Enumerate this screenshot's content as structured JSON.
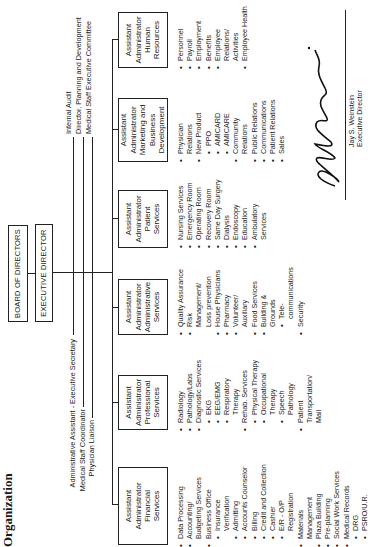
{
  "title": "Organization",
  "board": {
    "label": "BOARD OF DIRECTORS"
  },
  "executive": {
    "label": "EXECUTIVE DIRECTOR"
  },
  "staff_left": [
    "Administrative Assistant - Executive Secretary",
    "Medical Staff Coordinator",
    "Physician Liaison"
  ],
  "staff_right": [
    "Internal Audit",
    "Director, Planning and Development",
    "Medical Staff Executive Committee"
  ],
  "departments": [
    {
      "box": [
        "Assistant",
        "Administrator",
        "Financial",
        "Services"
      ],
      "items": [
        {
          "t": "Data Processing",
          "k": "b"
        },
        {
          "t": "Accounting/",
          "k": "b"
        },
        {
          "t": "Budgeting Services",
          "k": "cont"
        },
        {
          "t": "Business Office",
          "k": "b"
        },
        {
          "t": "Insurance",
          "k": "sub"
        },
        {
          "t": "Verification",
          "k": "subcont"
        },
        {
          "t": "Admitting",
          "k": "sub"
        },
        {
          "t": "Accounts Counselor",
          "k": "sub"
        },
        {
          "t": "Billing",
          "k": "sub"
        },
        {
          "t": "Credit and Collection",
          "k": "sub"
        },
        {
          "t": "Cashier",
          "k": "sub"
        },
        {
          "t": "E/R - O/P",
          "k": "sub"
        },
        {
          "t": "Registration",
          "k": "subcont"
        },
        {
          "t": "Materials",
          "k": "b"
        },
        {
          "t": "Management",
          "k": "cont"
        },
        {
          "t": "Plaza Building",
          "k": "b"
        },
        {
          "t": "Pre-planning",
          "k": "b"
        },
        {
          "t": "Social Work Services",
          "k": "b"
        },
        {
          "t": "Medical Records",
          "k": "b"
        },
        {
          "t": "DRG",
          "k": "sub"
        },
        {
          "t": "PSRO/U.R.",
          "k": "sub"
        }
      ]
    },
    {
      "box": [
        "Assistant",
        "Administrator",
        "Professional",
        "Services"
      ],
      "items": [
        {
          "t": "Radiology",
          "k": "b"
        },
        {
          "t": "Pathology/Labs",
          "k": "b"
        },
        {
          "t": "Diagnostic Services",
          "k": "b"
        },
        {
          "t": "EKG",
          "k": "sub"
        },
        {
          "t": "EEG/EMG",
          "k": "sub"
        },
        {
          "t": "Respiratory",
          "k": "sub"
        },
        {
          "t": "Therapy",
          "k": "subcont"
        },
        {
          "t": "Rehab. Services",
          "k": "b"
        },
        {
          "t": "Physical Therapy",
          "k": "sub"
        },
        {
          "t": "Occupational",
          "k": "sub"
        },
        {
          "t": "Therapy",
          "k": "subcont"
        },
        {
          "t": "Speech",
          "k": "sub"
        },
        {
          "t": "Pathology",
          "k": "subcont"
        },
        {
          "t": "Patient",
          "k": "b"
        },
        {
          "t": "Transportation/",
          "k": "cont"
        },
        {
          "t": "Mail",
          "k": "cont"
        }
      ]
    },
    {
      "box": [
        "Assistant",
        "Administrator",
        "Administrative",
        "Services"
      ],
      "items": [
        {
          "t": "Quality Assurance",
          "k": "b"
        },
        {
          "t": "Risk",
          "k": "b"
        },
        {
          "t": "Management/",
          "k": "cont"
        },
        {
          "t": "Loss prevention",
          "k": "cont"
        },
        {
          "t": "House Physicians",
          "k": "b"
        },
        {
          "t": "Pharmacy",
          "k": "b"
        },
        {
          "t": "Volunteer/",
          "k": "b"
        },
        {
          "t": "Auxiliary",
          "k": "cont"
        },
        {
          "t": "Food Services",
          "k": "b"
        },
        {
          "t": "Building &",
          "k": "b"
        },
        {
          "t": "Grounds",
          "k": "cont"
        },
        {
          "t": "Tele-",
          "k": "sub"
        },
        {
          "t": "communications",
          "k": "subcont"
        },
        {
          "t": "Security",
          "k": "b"
        }
      ]
    },
    {
      "box": [
        "Assistant",
        "Administrator",
        "Patient",
        "Services"
      ],
      "items": [
        {
          "t": "Nursing Services",
          "k": "b"
        },
        {
          "t": "Emergency Room",
          "k": "b"
        },
        {
          "t": "Operating Room",
          "k": "b"
        },
        {
          "t": "Recovery Room",
          "k": "b"
        },
        {
          "t": "Same Day Surgery",
          "k": "b"
        },
        {
          "t": "Dialysis",
          "k": "b"
        },
        {
          "t": "Endoscopy",
          "k": "b"
        },
        {
          "t": "Education",
          "k": "b"
        },
        {
          "t": "Ambulatory",
          "k": "b"
        },
        {
          "t": "Services",
          "k": "cont"
        }
      ]
    },
    {
      "box": [
        "Assistant",
        "Administrator",
        "Marketing and",
        "Business",
        "Development"
      ],
      "items": [
        {
          "t": "Physician",
          "k": "b"
        },
        {
          "t": "Relations",
          "k": "cont"
        },
        {
          "t": "New Product",
          "k": "b"
        },
        {
          "t": "PPO",
          "k": "sub"
        },
        {
          "t": "AMICARD",
          "k": "sub"
        },
        {
          "t": "AMICARE",
          "k": "sub"
        },
        {
          "t": "Community",
          "k": "b"
        },
        {
          "t": "Relations",
          "k": "cont"
        },
        {
          "t": "Public Relations",
          "k": "b"
        },
        {
          "t": "Communications",
          "k": "b"
        },
        {
          "t": "Patient Relations",
          "k": "b"
        },
        {
          "t": "Sales",
          "k": "b"
        }
      ]
    },
    {
      "box": [
        "Assistant",
        "Administrator",
        "Human",
        "Resources"
      ],
      "items": [
        {
          "t": "Personnel",
          "k": "b"
        },
        {
          "t": "Payroll",
          "k": "b"
        },
        {
          "t": "Employment",
          "k": "b"
        },
        {
          "t": "Benefits",
          "k": "b"
        },
        {
          "t": "Employee",
          "k": "b"
        },
        {
          "t": "Relations/",
          "k": "cont"
        },
        {
          "t": "Activities",
          "k": "cont"
        },
        {
          "t": "Employee Health",
          "k": "b"
        }
      ]
    }
  ],
  "signature": {
    "script": "Jay S. Weinstein",
    "name": "Jay S. Weinstein",
    "role": "Executive Director"
  }
}
